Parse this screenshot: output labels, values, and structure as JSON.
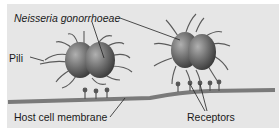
{
  "figure": {
    "labels": {
      "organism": "Neisseria gonorrhoeae",
      "pili": "Pili",
      "membrane": "Host cell membrane",
      "receptors": "Receptors"
    },
    "colors": {
      "background": "#e6e6e6",
      "bacterium": "#6a6a6a",
      "membrane": "#7a7a7a",
      "pili": "#5a5a5a",
      "text": "#1a1a1a"
    },
    "bacteria_count": 2,
    "receptor_count": 8
  }
}
